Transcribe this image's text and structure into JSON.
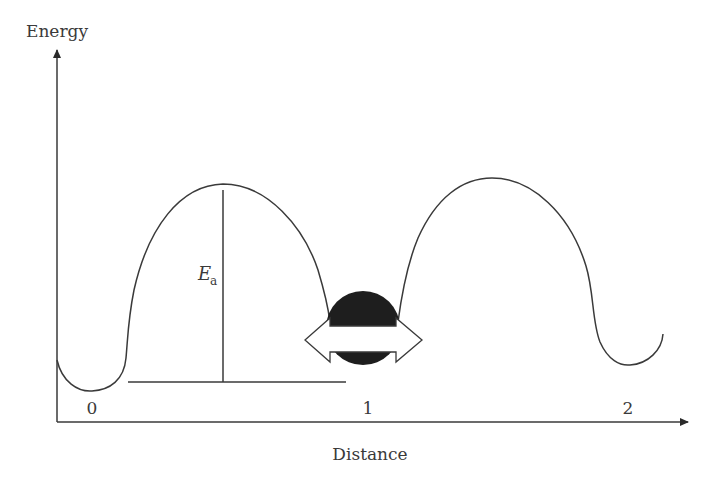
{
  "diagram": {
    "type": "potential-energy-landscape",
    "y_axis": {
      "label": "Energy"
    },
    "x_axis": {
      "label": "Distance",
      "tick_labels": [
        "0",
        "1",
        "2"
      ]
    },
    "annotation": {
      "main": "E",
      "subscript": "a",
      "meaning": "activation energy barrier height"
    },
    "object": "particle-hopping-between-wells",
    "colors": {
      "line": "#3a3a3a",
      "particle": "#1e1e1e",
      "background": "#ffffff"
    }
  }
}
